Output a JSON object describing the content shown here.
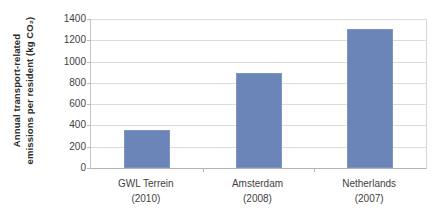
{
  "chart_data": {
    "type": "bar",
    "title": "",
    "xlabel": "",
    "ylabel": "Annual transport-related emissions per resident (kg CO₂)",
    "ylabel_line1": "Annual transport-related",
    "ylabel_line2": "emissions per resident (kg CO₂)",
    "categories": [
      "GWL Terrein",
      "Amsterdam",
      "Netherlands"
    ],
    "category_years": [
      "(2010)",
      "(2008)",
      "(2007)"
    ],
    "category_labels": [
      "GWL Terrein (2010)",
      "Amsterdam (2008)",
      "Netherlands (2007)"
    ],
    "values": [
      355,
      890,
      1305
    ],
    "ylim": [
      0,
      1400
    ],
    "ytick_values": [
      0,
      200,
      400,
      600,
      800,
      1000,
      1200,
      1400
    ],
    "ytick_labels": [
      "0",
      "200",
      "400",
      "600",
      "800",
      "1000",
      "1200",
      "1400"
    ],
    "grid": true,
    "legend": false,
    "series_color": "#6b85b8",
    "gridline_color": "#dcdcdc",
    "axis_color": "#b4b4b4"
  }
}
